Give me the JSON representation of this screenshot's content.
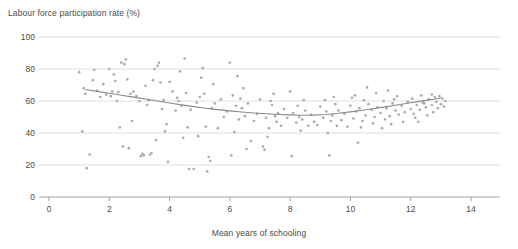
{
  "chart_data": {
    "type": "scatter",
    "title": "",
    "ylabel": "Labour force participation rate (%)",
    "xlabel": "Mean years of schooling",
    "xlim": [
      0,
      14
    ],
    "ylim": [
      0,
      100
    ],
    "xticks": [
      0,
      2,
      4,
      6,
      8,
      10,
      12,
      14
    ],
    "yticks": [
      0,
      20,
      40,
      60,
      80,
      100
    ],
    "grid": true,
    "legend": "none",
    "point_color": "#a8a8a8",
    "trend_color": "#8a8a8a",
    "grid_color": "#d8d8d8",
    "axis_color": "#9a9a9a",
    "series": [
      {
        "name": "countries",
        "points": [
          [
            1.0,
            78.0
          ],
          [
            1.1,
            41.0
          ],
          [
            1.2,
            64.5
          ],
          [
            1.25,
            18.0
          ],
          [
            1.35,
            26.5
          ],
          [
            1.5,
            79.5
          ],
          [
            1.6,
            66.5
          ],
          [
            1.7,
            62.5
          ],
          [
            1.8,
            70.5
          ],
          [
            1.9,
            64.0
          ],
          [
            2.0,
            80.0
          ],
          [
            2.05,
            63.0
          ],
          [
            2.1,
            66.0
          ],
          [
            2.2,
            72.5
          ],
          [
            2.3,
            65.5
          ],
          [
            2.4,
            84.0
          ],
          [
            2.45,
            31.5
          ],
          [
            2.5,
            83.0
          ],
          [
            2.55,
            86.0
          ],
          [
            2.6,
            73.5
          ],
          [
            2.65,
            30.5
          ],
          [
            2.7,
            64.5
          ],
          [
            2.8,
            66.0
          ],
          [
            2.9,
            63.0
          ],
          [
            3.0,
            60.0
          ],
          [
            3.05,
            25.5
          ],
          [
            3.1,
            27.0
          ],
          [
            3.15,
            26.0
          ],
          [
            3.2,
            69.5
          ],
          [
            3.3,
            60.5
          ],
          [
            3.35,
            26.5
          ],
          [
            3.4,
            27.5
          ],
          [
            3.5,
            80.0
          ],
          [
            3.55,
            35.5
          ],
          [
            3.6,
            82.0
          ],
          [
            3.65,
            84.0
          ],
          [
            3.7,
            71.5
          ],
          [
            3.75,
            55.0
          ],
          [
            3.8,
            60.5
          ],
          [
            3.9,
            45.5
          ],
          [
            4.0,
            72.0
          ],
          [
            4.1,
            66.0
          ],
          [
            4.2,
            54.0
          ],
          [
            4.3,
            60.0
          ],
          [
            4.4,
            57.0
          ],
          [
            4.5,
            86.5
          ],
          [
            4.55,
            65.0
          ],
          [
            4.6,
            43.5
          ],
          [
            4.65,
            17.5
          ],
          [
            4.7,
            54.5
          ],
          [
            4.8,
            17.5
          ],
          [
            4.9,
            59.0
          ],
          [
            5.0,
            62.5
          ],
          [
            5.1,
            80.5
          ],
          [
            5.2,
            44.0
          ],
          [
            5.25,
            16.0
          ],
          [
            5.3,
            25.0
          ],
          [
            5.4,
            55.5
          ],
          [
            5.5,
            58.5
          ],
          [
            5.6,
            43.0
          ],
          [
            5.7,
            61.0
          ],
          [
            5.8,
            50.0
          ],
          [
            5.9,
            53.5
          ],
          [
            6.0,
            84.0
          ],
          [
            6.05,
            26.0
          ],
          [
            6.1,
            63.5
          ],
          [
            6.2,
            57.0
          ],
          [
            6.3,
            48.5
          ],
          [
            6.4,
            55.5
          ],
          [
            6.5,
            50.5
          ],
          [
            6.6,
            58.5
          ],
          [
            6.7,
            35.0
          ],
          [
            6.8,
            47.5
          ],
          [
            6.9,
            52.0
          ],
          [
            7.0,
            61.0
          ],
          [
            7.1,
            31.5
          ],
          [
            7.15,
            29.5
          ],
          [
            7.2,
            49.5
          ],
          [
            7.3,
            43.0
          ],
          [
            7.4,
            57.5
          ],
          [
            7.5,
            50.5
          ],
          [
            7.55,
            47.0
          ],
          [
            7.6,
            52.5
          ],
          [
            7.7,
            44.5
          ],
          [
            7.8,
            55.0
          ],
          [
            7.9,
            49.5
          ],
          [
            8.0,
            66.0
          ],
          [
            8.05,
            25.5
          ],
          [
            8.1,
            52.5
          ],
          [
            8.2,
            46.5
          ],
          [
            8.3,
            50.0
          ],
          [
            8.4,
            48.5
          ],
          [
            8.5,
            54.0
          ],
          [
            8.6,
            44.5
          ],
          [
            8.7,
            51.5
          ],
          [
            8.8,
            47.0
          ],
          [
            8.9,
            45.0
          ],
          [
            9.0,
            56.5
          ],
          [
            9.1,
            49.5
          ],
          [
            9.2,
            53.5
          ],
          [
            9.3,
            26.0
          ],
          [
            9.35,
            47.5
          ],
          [
            9.4,
            51.0
          ],
          [
            9.5,
            58.0
          ],
          [
            9.55,
            44.5
          ],
          [
            9.6,
            54.0
          ],
          [
            9.7,
            48.0
          ],
          [
            9.8,
            52.0
          ],
          [
            9.9,
            44.0
          ],
          [
            10.0,
            57.0
          ],
          [
            10.05,
            62.0
          ],
          [
            10.1,
            49.0
          ],
          [
            10.2,
            53.5
          ],
          [
            10.25,
            34.0
          ],
          [
            10.3,
            55.5
          ],
          [
            10.4,
            47.5
          ],
          [
            10.5,
            51.0
          ],
          [
            10.55,
            68.5
          ],
          [
            10.6,
            58.0
          ],
          [
            10.7,
            54.5
          ],
          [
            10.8,
            50.0
          ],
          [
            10.85,
            65.0
          ],
          [
            10.9,
            56.0
          ],
          [
            11.0,
            52.5
          ],
          [
            11.05,
            43.0
          ],
          [
            11.1,
            60.0
          ],
          [
            11.2,
            55.5
          ],
          [
            11.25,
            66.5
          ],
          [
            11.3,
            50.5
          ],
          [
            11.4,
            58.5
          ],
          [
            11.5,
            54.0
          ],
          [
            11.55,
            63.0
          ],
          [
            11.6,
            51.5
          ],
          [
            11.7,
            57.0
          ],
          [
            11.8,
            53.0
          ],
          [
            11.9,
            59.5
          ],
          [
            12.0,
            55.0
          ],
          [
            12.05,
            61.5
          ],
          [
            12.1,
            52.0
          ],
          [
            12.2,
            57.5
          ],
          [
            12.3,
            54.5
          ],
          [
            12.35,
            63.5
          ],
          [
            12.4,
            59.0
          ],
          [
            12.5,
            56.0
          ],
          [
            12.55,
            51.0
          ],
          [
            12.6,
            61.0
          ],
          [
            12.7,
            57.5
          ],
          [
            12.75,
            53.0
          ],
          [
            12.8,
            62.5
          ],
          [
            12.85,
            59.5
          ],
          [
            12.9,
            55.5
          ],
          [
            12.95,
            63.0
          ],
          [
            13.0,
            58.0
          ],
          [
            13.05,
            61.5
          ],
          [
            13.1,
            56.5
          ],
          [
            1.45,
            73.0
          ],
          [
            2.15,
            76.5
          ],
          [
            3.45,
            73.0
          ],
          [
            4.35,
            78.5
          ],
          [
            5.45,
            70.5
          ],
          [
            6.45,
            68.0
          ],
          [
            7.45,
            64.5
          ],
          [
            8.45,
            60.5
          ],
          [
            9.45,
            62.5
          ],
          [
            10.45,
            60.5
          ],
          [
            11.45,
            61.0
          ],
          [
            12.45,
            58.5
          ],
          [
            2.75,
            47.5
          ],
          [
            3.85,
            41.0
          ],
          [
            4.95,
            38.0
          ],
          [
            6.15,
            40.5
          ],
          [
            7.25,
            37.5
          ],
          [
            8.35,
            41.5
          ],
          [
            9.25,
            40.0
          ],
          [
            10.35,
            43.5
          ],
          [
            11.35,
            45.5
          ],
          [
            12.25,
            47.0
          ],
          [
            5.05,
            74.5
          ],
          [
            6.25,
            75.5
          ],
          [
            1.15,
            68.0
          ],
          [
            2.25,
            60.0
          ],
          [
            3.25,
            57.5
          ],
          [
            4.25,
            62.0
          ],
          [
            5.15,
            64.5
          ],
          [
            6.35,
            61.5
          ],
          [
            7.35,
            60.0
          ],
          [
            8.25,
            57.0
          ],
          [
            9.15,
            60.5
          ],
          [
            10.15,
            63.5
          ],
          [
            11.15,
            48.5
          ],
          [
            12.15,
            49.5
          ],
          [
            13.15,
            60.0
          ],
          [
            4.45,
            37.0
          ],
          [
            3.95,
            22.0
          ],
          [
            5.35,
            22.5
          ],
          [
            6.55,
            30.0
          ],
          [
            2.35,
            43.5
          ],
          [
            12.7,
            64.0
          ],
          [
            11.75,
            47.0
          ],
          [
            10.75,
            46.0
          ]
        ]
      }
    ],
    "trend": {
      "name": "loess-fit",
      "points": [
        [
          1.2,
          67.2
        ],
        [
          1.6,
          66.0
        ],
        [
          2.0,
          64.8
        ],
        [
          2.4,
          63.6
        ],
        [
          2.8,
          62.4
        ],
        [
          3.2,
          61.2
        ],
        [
          3.6,
          60.0
        ],
        [
          4.0,
          58.8
        ],
        [
          4.4,
          57.6
        ],
        [
          4.8,
          56.5
        ],
        [
          5.2,
          55.5
        ],
        [
          5.6,
          54.6
        ],
        [
          6.0,
          53.8
        ],
        [
          6.4,
          53.1
        ],
        [
          6.8,
          52.5
        ],
        [
          7.2,
          52.0
        ],
        [
          7.6,
          51.6
        ],
        [
          8.0,
          51.3
        ],
        [
          8.4,
          51.1
        ],
        [
          8.8,
          51.2
        ],
        [
          9.2,
          51.6
        ],
        [
          9.6,
          52.3
        ],
        [
          10.0,
          53.2
        ],
        [
          10.4,
          54.2
        ],
        [
          10.8,
          55.3
        ],
        [
          11.2,
          56.5
        ],
        [
          11.6,
          57.7
        ],
        [
          12.0,
          58.9
        ],
        [
          12.4,
          60.1
        ],
        [
          12.8,
          61.3
        ],
        [
          13.0,
          61.9
        ]
      ]
    }
  }
}
